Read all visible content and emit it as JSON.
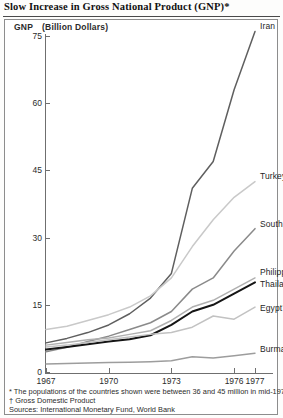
{
  "title": "Slow Increase in Gross National Product (GNP)*",
  "axis_caption": {
    "label": "GNP",
    "units": "(Billion Dollars)"
  },
  "footnotes": [
    "* The populations of the countries shown were between 36 and 45 million in mid-1977",
    "† Gross Domestic Product",
    "Sources:  International Monetary Fund, World Bank"
  ],
  "chart_data": {
    "type": "line",
    "title": "Slow Increase in Gross National Product (GNP)*",
    "xlabel": "",
    "ylabel": "GNP (Billion Dollars)",
    "xlim": [
      1967,
      1977
    ],
    "ylim": [
      0,
      78
    ],
    "yticks": [
      0,
      15,
      30,
      45,
      60,
      75
    ],
    "xticks": [
      1967,
      1970,
      1973,
      1976,
      1977
    ],
    "grid": false,
    "legend": "inline-right-labels",
    "x": [
      1967,
      1968,
      1969,
      1970,
      1971,
      1972,
      1973,
      1974,
      1975,
      1976,
      1977
    ],
    "series": [
      {
        "name": "Iran",
        "color": "#5f5f5f",
        "values": [
          6.5,
          7.5,
          8.8,
          10.5,
          13.0,
          16.5,
          22.0,
          41.0,
          47.0,
          63.0,
          76.0
        ]
      },
      {
        "name": "Turkey",
        "color": "#c9c9c9",
        "values": [
          9.5,
          10.2,
          11.5,
          12.8,
          14.5,
          17.0,
          21.0,
          28.0,
          34.0,
          39.0,
          42.5
        ]
      },
      {
        "name": "South Korea",
        "color": "#8a8a8a",
        "values": [
          4.5,
          5.5,
          6.8,
          8.0,
          9.5,
          11.0,
          13.5,
          18.5,
          21.0,
          27.0,
          32.0
        ]
      },
      {
        "name": "Philippines",
        "color": "#b0b0b0",
        "values": [
          6.0,
          6.6,
          7.2,
          7.6,
          8.4,
          9.2,
          11.5,
          14.5,
          16.0,
          18.5,
          21.0
        ]
      },
      {
        "name": "Thailand",
        "color": "#151515",
        "values": [
          5.0,
          5.6,
          6.2,
          6.8,
          7.3,
          8.2,
          10.5,
          13.5,
          15.0,
          17.5,
          20.0
        ]
      },
      {
        "name": "Egypt†",
        "color": "#c2c2c2",
        "values": [
          5.6,
          6.0,
          6.6,
          7.2,
          7.8,
          8.4,
          8.8,
          10.0,
          12.5,
          11.8,
          14.5
        ]
      },
      {
        "name": "Burma†",
        "color": "#9d9d9d",
        "values": [
          1.8,
          1.9,
          2.0,
          2.1,
          2.2,
          2.3,
          2.5,
          3.4,
          3.1,
          3.6,
          4.2
        ]
      }
    ]
  }
}
